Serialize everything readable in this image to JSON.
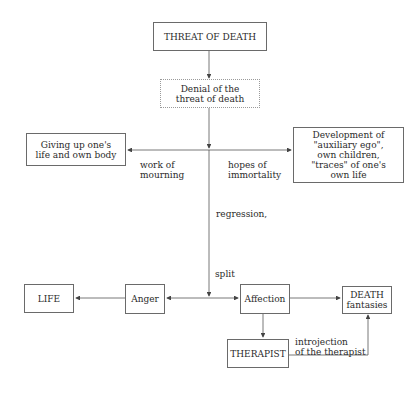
{
  "nodes": {
    "threat": "THREAT OF DEATH",
    "denial": "Denial of the\nthreat of death",
    "giving_up": "Giving up one's\nlife and own body",
    "development": "Development of\n\"auxiliary ego\",\nown children,\n\"traces\" of one's\nown life",
    "life": "LIFE",
    "anger": "Anger",
    "affection": "Affection",
    "death": "DEATH\nfantasies",
    "therapist": "THERAPIST"
  },
  "edge_labels": {
    "work_of_mourning": "work of\nmourning",
    "hopes_of_immortality": "hopes of\nimmortality",
    "regression": "regression,",
    "split": "split",
    "introjection": "introjection\nof the therapist"
  }
}
